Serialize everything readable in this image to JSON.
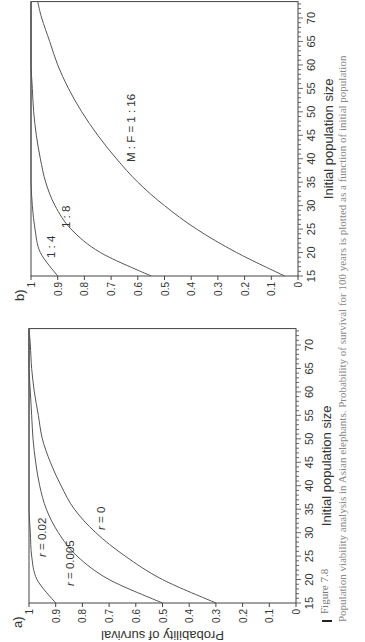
{
  "figure": {
    "number": "Figure 7.8",
    "caption": "Population viability analysis in Asian elephants. Probability of survival for 100 years is plotted as a function of initial population"
  },
  "panels": {
    "a": {
      "label": "a)",
      "xlabel": "Initial population size",
      "ylabel": "Probability of survival"
    },
    "b": {
      "label": "b)",
      "xlabel": "Initial population size",
      "ylabel": ""
    }
  },
  "chart_data": [
    {
      "type": "line",
      "panel": "a)",
      "title": "",
      "xlabel": "Initial population size",
      "ylabel": "Probability of survival",
      "xlim": [
        15,
        73.5
      ],
      "ylim": [
        0,
        1
      ],
      "xticks": [
        15,
        20,
        25,
        30,
        35,
        40,
        45,
        50,
        55,
        60,
        65,
        70
      ],
      "yticks": [
        0,
        0.1,
        0.2,
        0.3,
        0.4,
        0.5,
        0.6,
        0.7,
        0.8,
        0.9,
        1
      ],
      "grid": false,
      "x": [
        15,
        20,
        25,
        30,
        35,
        40,
        45,
        50,
        55,
        60,
        65,
        70,
        73.5
      ],
      "series": [
        {
          "name": "r = 0.02",
          "values": [
            0.9,
            0.97,
            0.99,
            0.995,
            1.0,
            1.0,
            1.0,
            1.0,
            1.0,
            1.0,
            1.0,
            1.0,
            1.0
          ]
        },
        {
          "name": "r = 0.005",
          "values": [
            0.5,
            0.7,
            0.82,
            0.89,
            0.935,
            0.96,
            0.975,
            0.985,
            0.99,
            0.995,
            1.0,
            1.0,
            1.0
          ]
        },
        {
          "name": "r = 0",
          "values": [
            0.3,
            0.5,
            0.64,
            0.75,
            0.83,
            0.88,
            0.92,
            0.95,
            0.965,
            0.98,
            0.99,
            0.995,
            1.0
          ]
        }
      ],
      "annotations": [
        "r = 0.02",
        "r = 0.005",
        "r = 0"
      ]
    },
    {
      "type": "line",
      "panel": "b)",
      "title": "",
      "xlabel": "Initial population size",
      "ylabel": "",
      "xlim": [
        15,
        73.5
      ],
      "ylim": [
        0,
        1
      ],
      "xticks": [
        15,
        20,
        25,
        30,
        35,
        40,
        45,
        50,
        55,
        60,
        65,
        70
      ],
      "yticks": [
        0,
        0.1,
        0.2,
        0.3,
        0.4,
        0.5,
        0.6,
        0.7,
        0.8,
        0.9,
        1
      ],
      "grid": false,
      "x": [
        15,
        20,
        25,
        30,
        35,
        40,
        45,
        50,
        55,
        60,
        65,
        70,
        73.5
      ],
      "series": [
        {
          "name": "1 : 4",
          "values": [
            0.9,
            0.965,
            0.985,
            0.995,
            1.0,
            1.0,
            1.0,
            1.0,
            1.0,
            1.0,
            1.0,
            1.0,
            1.0
          ]
        },
        {
          "name": "1 : 8",
          "values": [
            0.55,
            0.74,
            0.85,
            0.91,
            0.945,
            0.965,
            0.98,
            0.99,
            0.995,
            1.0,
            1.0,
            1.0,
            1.0
          ]
        },
        {
          "name": "M : F = 1 : 16",
          "values": [
            0.05,
            0.23,
            0.38,
            0.5,
            0.6,
            0.68,
            0.75,
            0.81,
            0.86,
            0.9,
            0.93,
            0.96,
            0.975
          ]
        }
      ],
      "annotations": [
        "1 : 4",
        "1 : 8",
        "M : F = 1 : 16"
      ]
    }
  ]
}
